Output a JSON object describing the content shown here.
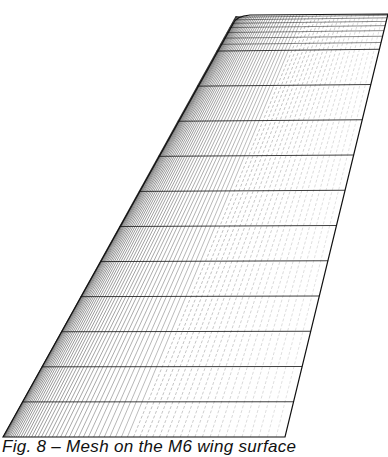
{
  "figure": {
    "type": "wing-surface-mesh",
    "outline": {
      "root_le": [
        3,
        437
      ],
      "root_te": [
        285,
        437
      ],
      "tip_le": [
        236,
        16
      ],
      "tip_te": [
        388,
        14
      ]
    },
    "spanwise_stations": 12,
    "chordwise_lines": 60,
    "ink_color": "#111111",
    "background": "#ffffff"
  },
  "caption": {
    "text": "Fig. 8 – Mesh on the M6 wing surface"
  }
}
